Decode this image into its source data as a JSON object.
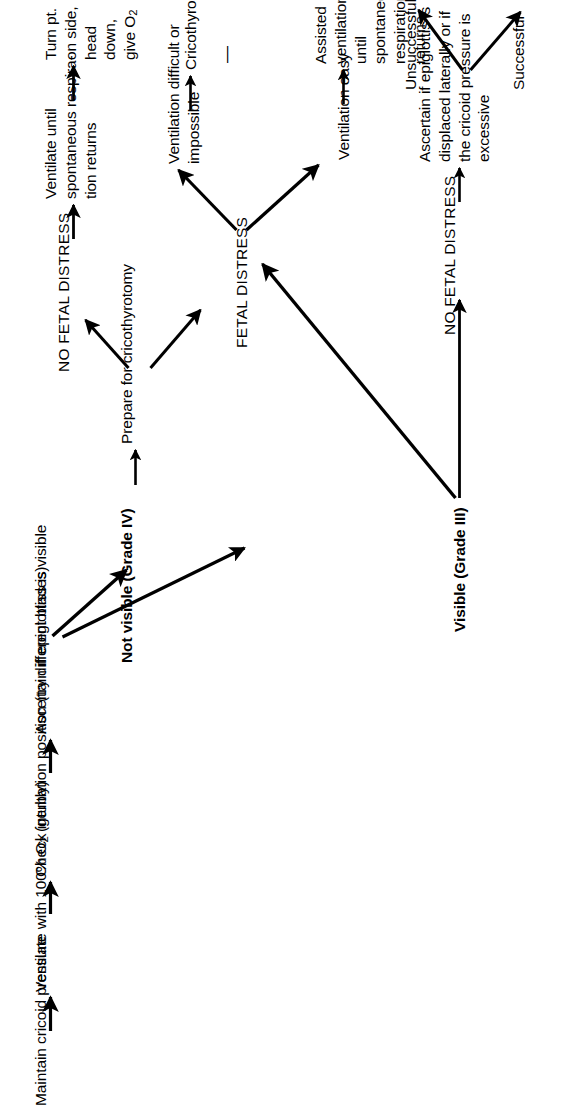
{
  "diagram": {
    "orientation": "rotated-90-ccw",
    "background": "#ffffff",
    "ink": "#000000",
    "nodes": {
      "maintain_cricoid": "Maintain cricoid pressure",
      "ventilate_100": "Ventilate with 100% O",
      "ventilate_100_sub": "2",
      "ventilate_100_tail": " (gently)",
      "check_intubation": "Check intubation position (try different blades)",
      "ascertain_epiglottis": "Ascertain if epiglottiss is visible",
      "not_visible": "Not visible (Grade IV)",
      "visible": "Visible (Grade III)",
      "prepare_cricothyrotomy": "Prepare for cricothyrotomy",
      "no_fetal_distress_top": "NO FETAL DISTRESS",
      "fetal_distress": "FETAL DISTRESS",
      "ventilate_until": "Ventilate until\nspontaneous respira-\ntion returns",
      "turn_pt": "Turn pt. on side, head\ndown, give O",
      "turn_pt_sub": "2",
      "ventilation_difficult": "Ventilation difficult or\nimpossible",
      "cricothyrotomy": "Cricothyrotomy",
      "cricothyrotomy_trailing_dash": "—",
      "ventilation_easy": "Ventilation easy",
      "assisted_ventilation": "Assisted ventilation\nuntil spontaneous\nrespiration returns",
      "no_fetal_distress_bottom": "NO FETAL DISTRESS",
      "ascertain_displaced": "Ascertain if epiglottis is\ndisplaced laterally or if\nthe cricoid pressure is\nexcessive",
      "successful": "Successful",
      "unsuccessful": "Unsuccessful"
    },
    "edges": [
      {
        "from": "maintain_cricoid",
        "to": "ventilate_100",
        "kind": "arrow-right"
      },
      {
        "from": "ventilate_100",
        "to": "check_intubation",
        "kind": "arrow-right"
      },
      {
        "from": "check_intubation",
        "to": "ascertain_epiglottis",
        "kind": "arrow-right"
      },
      {
        "from": "ascertain_epiglottis",
        "to": "not_visible",
        "kind": "arrow-diagonal-up"
      },
      {
        "from": "ascertain_epiglottis",
        "to": "visible",
        "kind": "arrow-diagonal-down"
      },
      {
        "from": "not_visible",
        "to": "prepare_cricothyrotomy",
        "kind": "arrow-right"
      },
      {
        "from": "prepare_cricothyrotomy",
        "to": "no_fetal_distress_top",
        "kind": "arrow-diagonal-up"
      },
      {
        "from": "prepare_cricothyrotomy",
        "to": "fetal_distress",
        "kind": "arrow-diagonal-down"
      },
      {
        "from": "no_fetal_distress_top",
        "to": "ventilate_until",
        "kind": "arrow-right"
      },
      {
        "from": "ventilate_until",
        "to": "turn_pt",
        "kind": "arrow-right"
      },
      {
        "from": "fetal_distress",
        "to": "ventilation_difficult",
        "kind": "arrow-diagonal-up"
      },
      {
        "from": "fetal_distress",
        "to": "ventilation_easy",
        "kind": "arrow-diagonal-down"
      },
      {
        "from": "ventilation_difficult",
        "to": "cricothyrotomy",
        "kind": "arrow-right"
      },
      {
        "from": "ventilation_easy",
        "to": "assisted_ventilation",
        "kind": "arrow-right"
      },
      {
        "from": "visible",
        "to": "no_fetal_distress_bottom",
        "kind": "arrow-right"
      },
      {
        "from": "visible",
        "to": "fetal_distress",
        "kind": "arrow-long-diagonal-up"
      },
      {
        "from": "no_fetal_distress_bottom",
        "to": "ascertain_displaced",
        "kind": "arrow-right"
      },
      {
        "from": "ascertain_displaced",
        "to": "unsuccessful",
        "kind": "arrow-diagonal-up"
      },
      {
        "from": "ascertain_displaced",
        "to": "successful",
        "kind": "arrow-diagonal-down"
      }
    ]
  }
}
